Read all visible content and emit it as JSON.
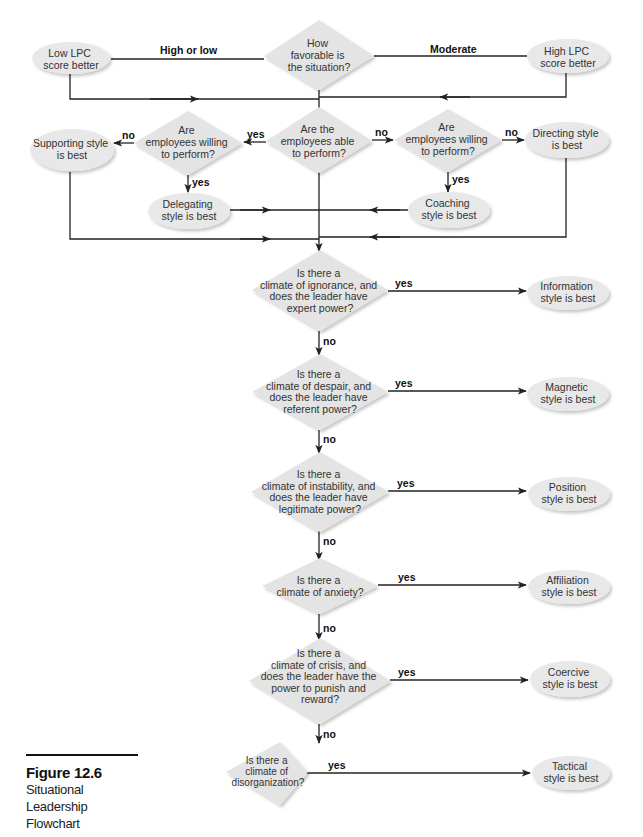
{
  "figure": {
    "number": "Figure 12.6",
    "title_line1": "Situational Leadership",
    "title_line2": "Flowchart"
  },
  "colors": {
    "diamond_fill": "#e4e4e4",
    "ellipse_fill": "#e8e8e8",
    "line": "#222222",
    "shadow": "#c8c8c8"
  },
  "nodes": {
    "favorable": {
      "type": "decision",
      "lines": [
        "How",
        "favorable is",
        "the situation?"
      ]
    },
    "low_lpc": {
      "type": "outcome",
      "lines": [
        "Low LPC",
        "score better"
      ]
    },
    "high_lpc": {
      "type": "outcome",
      "lines": [
        "High LPC",
        "score better"
      ]
    },
    "able": {
      "type": "decision",
      "lines": [
        "Are the",
        "employees able",
        "to perform?"
      ]
    },
    "willing_left": {
      "type": "decision",
      "lines": [
        "Are",
        "employees willing",
        "to perform?"
      ]
    },
    "willing_right": {
      "type": "decision",
      "lines": [
        "Are",
        "employees willing",
        "to perform?"
      ]
    },
    "supporting": {
      "type": "outcome",
      "lines": [
        "Supporting style",
        "is best"
      ]
    },
    "delegating": {
      "type": "outcome",
      "lines": [
        "Delegating",
        "style is best"
      ]
    },
    "coaching": {
      "type": "outcome",
      "lines": [
        "Coaching",
        "style is best"
      ]
    },
    "directing": {
      "type": "outcome",
      "lines": [
        "Directing style",
        "is best"
      ]
    },
    "ignorance": {
      "type": "decision",
      "lines": [
        "Is there a",
        "climate of ignorance, and",
        "does the leader have",
        "expert power?"
      ]
    },
    "information": {
      "type": "outcome",
      "lines": [
        "Information",
        "style is best"
      ]
    },
    "despair": {
      "type": "decision",
      "lines": [
        "Is there a",
        "climate of despair, and",
        "does the leader have",
        "referent power?"
      ]
    },
    "magnetic": {
      "type": "outcome",
      "lines": [
        "Magnetic",
        "style is best"
      ]
    },
    "instability": {
      "type": "decision",
      "lines": [
        "Is there a",
        "climate of instability, and",
        "does the leader have",
        "legitimate power?"
      ]
    },
    "position": {
      "type": "outcome",
      "lines": [
        "Position",
        "style is best"
      ]
    },
    "anxiety": {
      "type": "decision",
      "lines": [
        "Is there a",
        "climate of anxiety?"
      ]
    },
    "affiliation": {
      "type": "outcome",
      "lines": [
        "Affiliation",
        "style is best"
      ]
    },
    "crisis": {
      "type": "decision",
      "lines": [
        "Is there a",
        "climate of crisis, and",
        "does the leader have the",
        "power to punish and",
        "reward?"
      ]
    },
    "coercive": {
      "type": "outcome",
      "lines": [
        "Coercive",
        "style is best"
      ]
    },
    "disorganization": {
      "type": "decision",
      "lines": [
        "Is there a",
        "climate of",
        "disorganization?"
      ]
    },
    "tactical": {
      "type": "outcome",
      "lines": [
        "Tactical",
        "style is best"
      ]
    }
  },
  "edge_labels": {
    "high_or_low": "High or low",
    "moderate": "Moderate",
    "able_yes": "yes",
    "able_no": "no",
    "willing_left_no": "no",
    "willing_left_yes": "yes",
    "willing_right_no": "no",
    "willing_right_yes": "yes",
    "ignorance_yes": "yes",
    "ignorance_no": "no",
    "despair_yes": "yes",
    "despair_no": "no",
    "instability_yes": "yes",
    "instability_no": "no",
    "anxiety_yes": "yes",
    "anxiety_no": "no",
    "crisis_yes": "yes",
    "crisis_no": "no",
    "disorganization_yes": "yes"
  }
}
